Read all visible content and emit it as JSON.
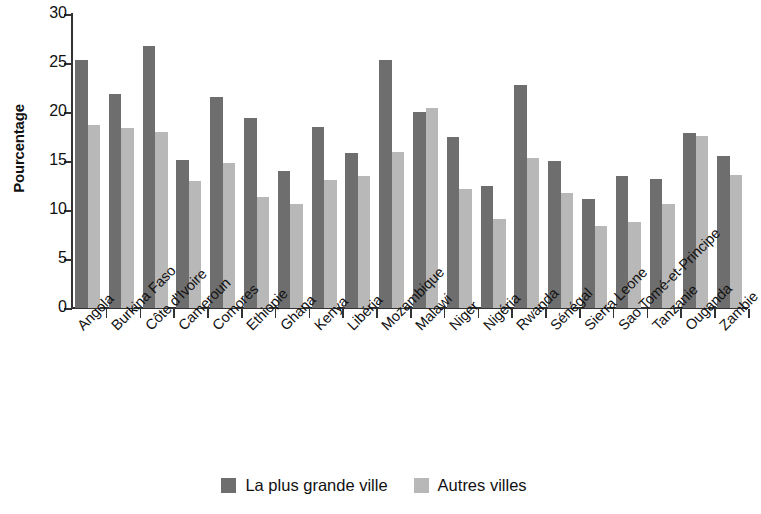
{
  "chart_data": {
    "type": "bar",
    "title": "",
    "xlabel": "",
    "ylabel": "Pourcentage",
    "ylim": [
      0,
      30
    ],
    "ytick_labels": [
      "0",
      "5",
      "10",
      "15",
      "20",
      "25",
      "30"
    ],
    "yticks": [
      0,
      5,
      10,
      15,
      20,
      25,
      30
    ],
    "grid": false,
    "legend_position": "bottom-center",
    "categories": [
      "Angola",
      "Burkina Faso",
      "Côte d'Ivoire",
      "Cameroun",
      "Comores",
      "Ethiopie",
      "Ghana",
      "Kenya",
      "Libéria",
      "Mozambique",
      "Malawi",
      "Niger",
      "Nigéria",
      "Rwanda",
      "Sénégal",
      "Sierra Leone",
      "Sao Tomé-et-Principe",
      "Tanzanie",
      "Ouganda",
      "Zambie"
    ],
    "series": [
      {
        "name": "La plus grande ville",
        "color": "#6e6e6e",
        "values": [
          25.3,
          21.8,
          26.7,
          15.1,
          21.5,
          19.4,
          14.0,
          18.5,
          15.8,
          25.3,
          20.0,
          17.4,
          12.4,
          22.8,
          15.0,
          11.1,
          13.5,
          13.2,
          17.9,
          15.5
        ]
      },
      {
        "name": "Autres villes",
        "color": "#b8b8b8",
        "values": [
          18.7,
          18.4,
          18.0,
          13.0,
          14.8,
          11.3,
          10.6,
          13.1,
          13.5,
          15.9,
          20.4,
          12.1,
          9.1,
          15.3,
          11.7,
          8.4,
          8.8,
          10.6,
          17.6,
          13.6
        ]
      }
    ],
    "legend": [
      {
        "label": "La plus grande ville",
        "color": "#6e6e6e"
      },
      {
        "label": "Autres villes",
        "color": "#b8b8b8"
      }
    ]
  }
}
